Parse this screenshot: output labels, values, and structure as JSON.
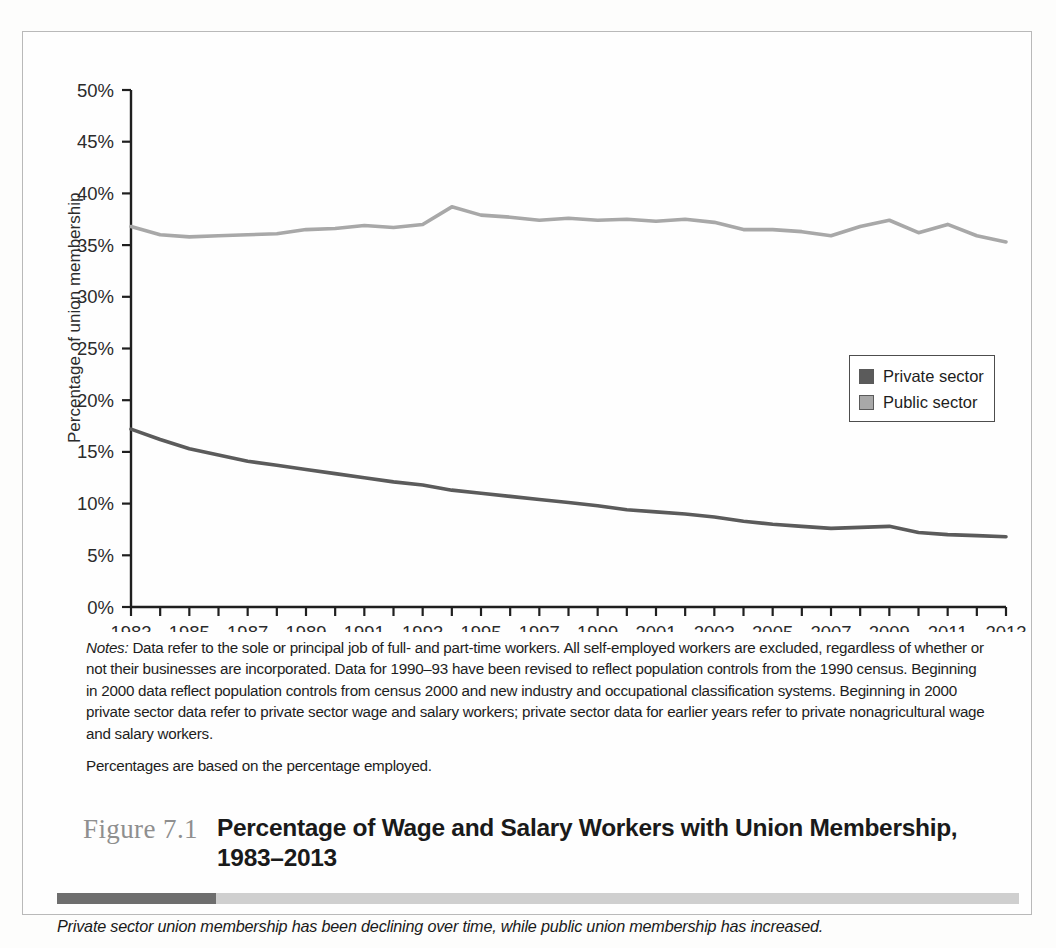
{
  "figure": {
    "number": "Figure 7.1",
    "title": "Percentage of Wage and Salary Workers with Union Membership, 1983–2013",
    "caption": "Private sector union membership has been declining over time, while public union membership has increased."
  },
  "notes": {
    "lead": "Notes:",
    "paragraph1": " Data refer to the sole or principal job of full- and part-time workers. All self-employed workers are excluded, regardless of whether or not their businesses are incorporated. Data for 1990–93 have been revised to reflect population controls from the 1990 census. Beginning in 2000 data reflect population controls from census 2000 and new industry and occupational classification systems. Beginning in 2000 private sector data refer to private sector wage and salary workers; private sector data for earlier years refer to private nonagricultural wage and salary workers.",
    "paragraph2": "Percentages are based on the percentage employed."
  },
  "legend": {
    "items": [
      {
        "label": "Private sector",
        "color": "#5b5b5b"
      },
      {
        "label": "Public sector",
        "color": "#a8a8a8"
      }
    ]
  },
  "chart_data": {
    "type": "line",
    "title": "Percentage of Wage and Salary Workers with Union Membership, 1983–2013",
    "xlabel": "",
    "ylabel": "Percentage of union membership",
    "xlim": [
      1983,
      2013
    ],
    "ylim": [
      0,
      50
    ],
    "yticks": [
      0,
      5,
      10,
      15,
      20,
      25,
      30,
      35,
      40,
      45,
      50
    ],
    "ytick_labels": [
      "0%",
      "5%",
      "10%",
      "15%",
      "20%",
      "25%",
      "30%",
      "35%",
      "40%",
      "45%",
      "50%"
    ],
    "xticks": [
      1983,
      1984,
      1985,
      1986,
      1987,
      1988,
      1989,
      1990,
      1991,
      1992,
      1993,
      1994,
      1995,
      1996,
      1997,
      1998,
      1999,
      2000,
      2001,
      2002,
      2003,
      2004,
      2005,
      2006,
      2007,
      2008,
      2009,
      2010,
      2011,
      2012,
      2013
    ],
    "xtick_labels": [
      "1983",
      "",
      "1985",
      "",
      "1987",
      "",
      "1989",
      "",
      "1991",
      "",
      "1993",
      "",
      "1995",
      "",
      "1997",
      "",
      "1999",
      "",
      "2001",
      "",
      "2003",
      "",
      "2005",
      "",
      "2007",
      "",
      "2009",
      "",
      "2011",
      "",
      "2013"
    ],
    "grid": false,
    "legend_position": "right-middle",
    "x": [
      1983,
      1984,
      1985,
      1986,
      1987,
      1988,
      1989,
      1990,
      1991,
      1992,
      1993,
      1994,
      1995,
      1996,
      1997,
      1998,
      1999,
      2000,
      2001,
      2002,
      2003,
      2004,
      2005,
      2006,
      2007,
      2008,
      2009,
      2010,
      2011,
      2012,
      2013
    ],
    "series": [
      {
        "name": "Private sector",
        "color": "#5b5b5b",
        "values": [
          17.2,
          16.2,
          15.3,
          14.7,
          14.1,
          13.7,
          13.3,
          12.9,
          12.5,
          12.1,
          11.8,
          11.3,
          11.0,
          10.7,
          10.4,
          10.1,
          9.8,
          9.4,
          9.2,
          9.0,
          8.7,
          8.3,
          8.0,
          7.8,
          7.6,
          7.7,
          7.8,
          7.2,
          7.0,
          6.9,
          6.8
        ]
      },
      {
        "name": "Public sector",
        "color": "#a8a8a8",
        "values": [
          36.8,
          36.0,
          35.8,
          35.9,
          36.0,
          36.1,
          36.5,
          36.6,
          36.9,
          36.7,
          37.0,
          38.7,
          37.9,
          37.7,
          37.4,
          37.6,
          37.4,
          37.5,
          37.3,
          37.5,
          37.2,
          36.5,
          36.5,
          36.3,
          35.9,
          36.8,
          37.4,
          36.2,
          37.0,
          35.9,
          35.3
        ]
      }
    ]
  }
}
